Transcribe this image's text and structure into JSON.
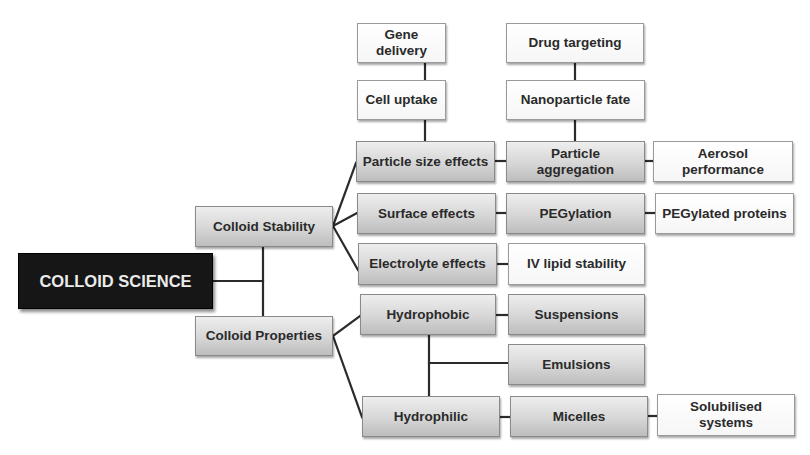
{
  "diagram": {
    "type": "hierarchical mind map",
    "root": {
      "label": "COLLOID SCIENCE",
      "color": "#161616"
    },
    "level1": [
      {
        "id": "stability",
        "label": "Colloid Stability"
      },
      {
        "id": "properties",
        "label": "Colloid Properties"
      }
    ],
    "stability_children": [
      {
        "id": "size",
        "label": "Particle size effects"
      },
      {
        "id": "surface",
        "label": "Surface effects"
      },
      {
        "id": "electrolyte",
        "label": "Electrolyte effects"
      }
    ],
    "size_chain": [
      {
        "id": "cell",
        "label": "Cell uptake"
      },
      {
        "id": "gene",
        "label": "Gene delivery"
      }
    ],
    "size_right": [
      {
        "id": "aggregation",
        "label": "Particle aggregation"
      },
      {
        "id": "aerosol",
        "label": "Aerosol performance"
      }
    ],
    "aggregation_up": [
      {
        "id": "fate",
        "label": "Nanoparticle fate"
      },
      {
        "id": "drug",
        "label": "Drug targeting"
      }
    ],
    "surface_chain": [
      {
        "id": "peg",
        "label": "PEGylation"
      },
      {
        "id": "pegprot",
        "label": "PEGylated proteins"
      }
    ],
    "electrolyte_chain": [
      {
        "id": "iv",
        "label": "IV lipid stability"
      }
    ],
    "properties_children": [
      {
        "id": "hydrophobic",
        "label": "Hydrophobic"
      },
      {
        "id": "hydrophilic",
        "label": "Hydrophilic"
      }
    ],
    "hydrophobic_chain": [
      {
        "id": "susp",
        "label": "Suspensions"
      }
    ],
    "shared_child": {
      "id": "emul",
      "label": "Emulsions"
    },
    "hydrophilic_chain": [
      {
        "id": "micelles",
        "label": "Micelles"
      },
      {
        "id": "solub",
        "label": "Solubilised systems"
      }
    ],
    "colors": {
      "grey_box_top": "#eeeeee",
      "grey_box_bottom": "#bdbdbd",
      "white_box": "#ffffff",
      "line": "#2b2b2b",
      "text": "#2a2a2a"
    }
  }
}
